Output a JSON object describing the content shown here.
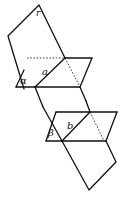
{
  "diagram": {
    "labels": {
      "r": "r",
      "a": "a",
      "alpha": "α",
      "b": "b",
      "beta": "β"
    },
    "colors": {
      "stroke": "#111111",
      "background": "#ffffff"
    }
  }
}
